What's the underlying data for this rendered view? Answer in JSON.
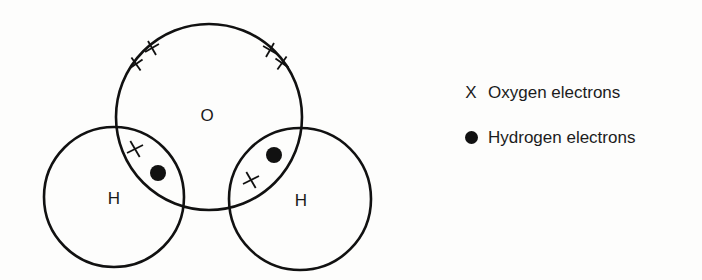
{
  "diagram": {
    "atoms": [
      {
        "symbol": "O",
        "label": "O"
      },
      {
        "symbol": "H",
        "label": "H"
      },
      {
        "symbol": "H",
        "label": "H"
      }
    ],
    "legend": [
      {
        "marker": "X",
        "marker_type": "cross",
        "label": "Oxygen electrons"
      },
      {
        "marker": "●",
        "marker_type": "dot",
        "label": "Hydrogen electrons"
      }
    ],
    "colors": {
      "line": "#111111",
      "background": "#fdfdfc"
    }
  }
}
